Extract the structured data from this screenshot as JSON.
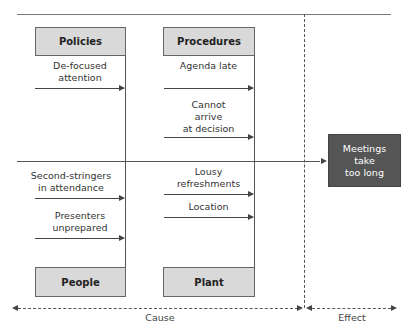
{
  "diagram": {
    "type": "cause-and-effect (fishbone)",
    "categories": [
      {
        "name": "Policies",
        "causes": [
          "De-focused\nattention"
        ]
      },
      {
        "name": "Procedures",
        "causes": [
          "Agenda late",
          "Cannot\narrive\nat decision"
        ]
      },
      {
        "name": "People",
        "causes": [
          "Second-stringers\nin attendance",
          "Presenters\nunprepared"
        ]
      },
      {
        "name": "Plant",
        "causes": [
          "Lousy\nrefreshments",
          "Location"
        ]
      }
    ],
    "effect": "Meetings\ntake\ntoo long",
    "axis": {
      "cause_label": "Cause",
      "effect_label": "Effect"
    }
  },
  "colors": {
    "category_fill": "#d9d9d9",
    "effect_fill": "#555555",
    "line": "#555555"
  }
}
